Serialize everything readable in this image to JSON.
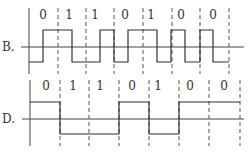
{
  "diagrams": [
    {
      "label": "B.",
      "bits": [
        "0",
        "1",
        "1",
        "0",
        "1",
        "0",
        "0"
      ],
      "encoding_levels": "high-low transitions (option B)",
      "geometry": {
        "axis_x": 29,
        "baseline_y": 47,
        "high_y": 30,
        "low_y": 62,
        "dash_x": [
          58,
          86,
          114,
          143,
          172,
          200,
          229
        ],
        "bit_label_x": [
          43,
          69,
          95,
          125,
          151,
          181,
          213
        ],
        "bit_label_y": 19,
        "wave_points": "29,62 43,62 43,30 72,30 72,62 100,62 100,30 114,30 114,62 128,62 128,30 157,30 157,62 171,62 171,30 185,30 185,62 200,62 200,30 213,30 213,62 229,62"
      }
    },
    {
      "label": "D.",
      "bits": [
        "0",
        "1",
        "1",
        "0",
        "1",
        "0",
        "0"
      ],
      "encoding_levels": "NRZ-style levels (option D)",
      "geometry": {
        "axis_x": 30,
        "baseline_y": 119,
        "high_y": 102,
        "low_y": 134,
        "dash_x": [
          60,
          89,
          119,
          149,
          179,
          209,
          240
        ],
        "bit_label_x": [
          46,
          73,
          100,
          132,
          158,
          190,
          224
        ],
        "bit_label_y": 90,
        "wave_points": "30,102 60,102 60,134 119,134 119,102 149,102 149,134 179,134 179,102 240,102"
      }
    }
  ]
}
